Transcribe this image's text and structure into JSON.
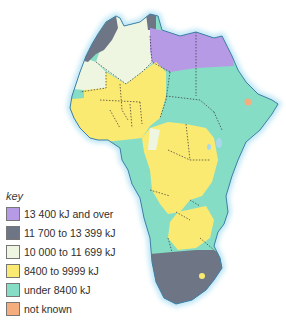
{
  "colors": {
    "c13400": "#b79ae6",
    "c11700": "#6e7685",
    "c10000": "#eef6e2",
    "c8400": "#fbea72",
    "under8400": "#86ddc6",
    "unknown": "#f6ad7e",
    "coast_glow": "#b7e4f4",
    "coast_line": "#3d7ea6"
  },
  "key": {
    "title": "key",
    "items": [
      {
        "label": "13 400 kJ and over",
        "color": "#b79ae6"
      },
      {
        "label": "11 700 to 13 399 kJ",
        "color": "#6e7685"
      },
      {
        "label": "10 000 to 11 699 kJ",
        "color": "#eef6e2"
      },
      {
        "label": "8400 to 9999 kJ",
        "color": "#fbea72"
      },
      {
        "label": "under 8400 kJ",
        "color": "#86ddc6"
      },
      {
        "label": "not known",
        "color": "#f6ad7e"
      }
    ]
  },
  "regions": [
    {
      "name": "Morocco",
      "category": "11 700 to 13 399 kJ"
    },
    {
      "name": "Algeria",
      "category": "10 000 to 11 699 kJ"
    },
    {
      "name": "Tunisia",
      "category": "11 700 to 13 399 kJ"
    },
    {
      "name": "Libya",
      "category": "13 400 kJ and over"
    },
    {
      "name": "Egypt",
      "category": "13 400 kJ and over"
    },
    {
      "name": "Mauritania",
      "category": "10 000 to 11 699 kJ"
    },
    {
      "name": "West Africa",
      "category": "8400 to 9999 kJ"
    },
    {
      "name": "Senegal",
      "category": "under 8400 kJ"
    },
    {
      "name": "Sudan / Chad / Horn",
      "category": "under 8400 kJ"
    },
    {
      "name": "Djibouti",
      "category": "not known"
    },
    {
      "name": "Central Africa",
      "category": "8400 to 9999 kJ"
    },
    {
      "name": "Angola / Mozambique",
      "category": "under 8400 kJ"
    },
    {
      "name": "South Africa",
      "category": "11 700 to 13 399 kJ"
    }
  ]
}
